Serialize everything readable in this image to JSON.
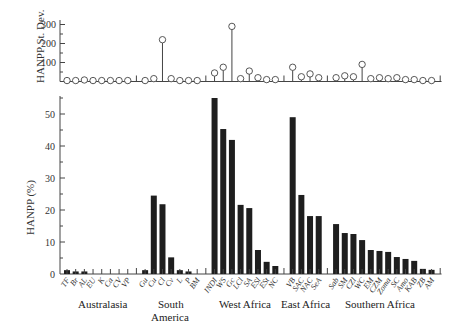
{
  "chart_data": [
    {
      "type": "stem",
      "title": "",
      "ylabel": "HANPP St. Dev.",
      "xlabel": "",
      "ylim": [
        0,
        310
      ],
      "yticks": [
        100,
        200,
        300
      ],
      "grid": false,
      "categories": [
        "TF",
        "Br",
        "AL",
        "EU",
        "K",
        "Ca",
        "CV",
        "VP",
        "Gu",
        "Cu",
        "Cl",
        "Cv",
        "L",
        "P",
        "BM",
        "INDI",
        "WS",
        "Gc",
        "LCl",
        "SA",
        "ESl",
        "ESt",
        "NC",
        "VB",
        "SAC",
        "NAC",
        "SeA",
        "Sab",
        "SM",
        "CZl",
        "WC",
        "EM",
        "CZM",
        "Zoma",
        "SC",
        "Amo",
        "KAB",
        "ZB",
        "AM"
      ],
      "values": [
        5,
        5,
        8,
        5,
        5,
        5,
        5,
        5,
        5,
        15,
        220,
        15,
        5,
        5,
        5,
        45,
        75,
        290,
        15,
        55,
        20,
        10,
        10,
        75,
        25,
        40,
        20,
        20,
        30,
        25,
        90,
        15,
        20,
        15,
        20,
        10,
        10,
        5,
        5
      ]
    },
    {
      "type": "bar",
      "title": "",
      "ylabel": "HANPP (%)",
      "xlabel": "",
      "ylim": [
        0,
        56
      ],
      "yticks": [
        10,
        20,
        30,
        40,
        50
      ],
      "grid": false,
      "categories": [
        "TF",
        "Br",
        "AL",
        "EU",
        "K",
        "Ca",
        "CV",
        "VP",
        "Gu",
        "Cu",
        "Cl",
        "Cv",
        "L",
        "P",
        "BM",
        "INDI",
        "WS",
        "Gc",
        "LCl",
        "SA",
        "ESl",
        "ESt",
        "NC",
        "VB",
        "SAC",
        "NAC",
        "SeA",
        "Sab",
        "SM",
        "CZl",
        "WC",
        "EM",
        "CZM",
        "Zoma",
        "SC",
        "Amo",
        "KAB",
        "ZB",
        "AM"
      ],
      "values": [
        1.2,
        0.8,
        0.8,
        0,
        0,
        0,
        0,
        0,
        1.2,
        24.5,
        21.8,
        5.2,
        1.2,
        0.8,
        0,
        55,
        45.3,
        41.9,
        21.6,
        20.6,
        7.5,
        3.8,
        2.5,
        49,
        24.7,
        18.1,
        18.1,
        15.6,
        12.8,
        12.5,
        10.6,
        7.5,
        7.2,
        6.9,
        5.3,
        4.7,
        4.1,
        1.6,
        1.3
      ],
      "groups": [
        {
          "name": "Australasia",
          "count": 8
        },
        {
          "name": "South America",
          "count": 7
        },
        {
          "name": "West Africa",
          "count": 8
        },
        {
          "name": "East Africa",
          "count": 4
        },
        {
          "name": "Southern Africa",
          "count": 12
        }
      ]
    }
  ],
  "labels": {
    "top_ylabel": "HANPP St. Dev.",
    "bottom_ylabel": "HANPP (%)",
    "regions": [
      "Australasia",
      "South",
      "America",
      "West Africa",
      "East Africa",
      "Southern Africa"
    ]
  }
}
